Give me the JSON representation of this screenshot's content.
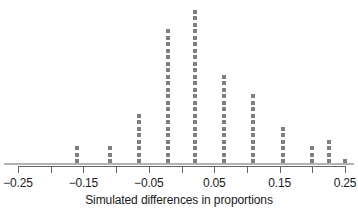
{
  "chart_data": {
    "type": "scatter",
    "plot_style": "dotplot",
    "title": "",
    "subtitle": "",
    "xlabel": "Simulated differences in proportions",
    "ylabel": "",
    "xlim": [
      -0.27,
      0.27
    ],
    "xticks": [
      -0.25,
      -0.2,
      -0.15,
      -0.1,
      -0.05,
      0.0,
      0.05,
      0.1,
      0.15,
      0.2,
      0.25
    ],
    "xticklabels": [
      "-0.25",
      "",
      "-0.15",
      "",
      "-0.05",
      "",
      "0.05",
      "",
      "0.15",
      "",
      "0.25"
    ],
    "grid": false,
    "legend": null,
    "dot_color": "#7f7f7f",
    "axis_color": "#b3b3b3",
    "categories": [
      -0.16,
      -0.11,
      -0.065,
      -0.02,
      0.02,
      0.065,
      0.11,
      0.155,
      0.2,
      0.225,
      0.25
    ],
    "values": [
      3,
      3,
      8,
      21,
      24,
      14,
      11,
      6,
      3,
      4,
      1
    ],
    "total_points": 98,
    "annotations": []
  },
  "axis": {
    "tick_labels": [
      {
        "value": -0.25,
        "text": "-0.25"
      },
      {
        "value": -0.2,
        "text": ""
      },
      {
        "value": -0.15,
        "text": "-0.15"
      },
      {
        "value": -0.1,
        "text": ""
      },
      {
        "value": -0.05,
        "text": "-0.05"
      },
      {
        "value": 0.0,
        "text": ""
      },
      {
        "value": 0.05,
        "text": "0.05"
      },
      {
        "value": 0.1,
        "text": ""
      },
      {
        "value": 0.15,
        "text": "0.15"
      },
      {
        "value": 0.2,
        "text": ""
      },
      {
        "value": 0.25,
        "text": "0.25"
      }
    ],
    "xlabel": "Simulated differences in proportions"
  }
}
